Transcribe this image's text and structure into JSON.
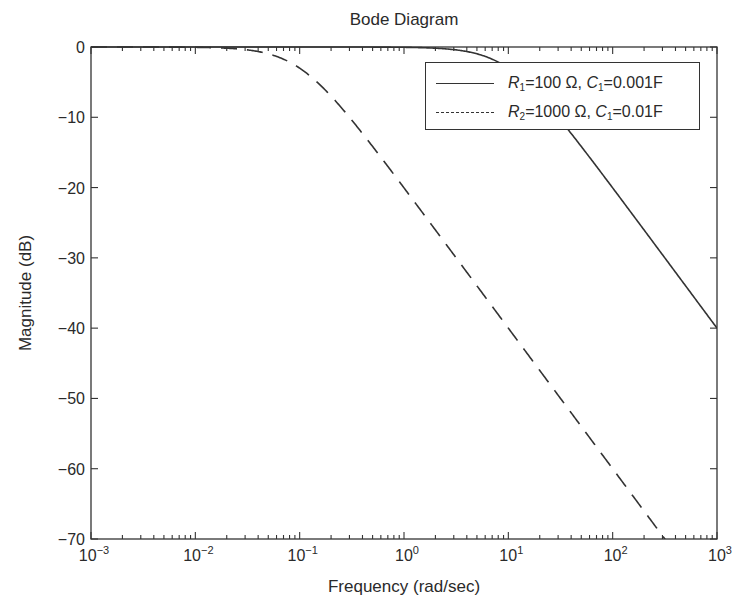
{
  "chart_data": {
    "type": "line",
    "title": "Bode Diagram",
    "xlabel": "Frequency (rad/sec)",
    "ylabel": "Magnitude (dB)",
    "xscale": "log",
    "xlim": [
      0.001,
      1000
    ],
    "ylim": [
      -70,
      0
    ],
    "grid": false,
    "legend_position": "upper right",
    "x_ticks": [
      0.001,
      0.01,
      0.1,
      1,
      10,
      100,
      1000
    ],
    "x_tick_labels": [
      {
        "base": "10",
        "exp": "−3"
      },
      {
        "base": "10",
        "exp": "−2"
      },
      {
        "base": "10",
        "exp": "−1"
      },
      {
        "base": "10",
        "exp": "0"
      },
      {
        "base": "10",
        "exp": "1"
      },
      {
        "base": "10",
        "exp": "2"
      },
      {
        "base": "10",
        "exp": "3"
      }
    ],
    "y_ticks": [
      0,
      -10,
      -20,
      -30,
      -40,
      -50,
      -60,
      -70
    ],
    "y_tick_labels": [
      "0",
      "−10",
      "−20",
      "−30",
      "−40",
      "−50",
      "−60",
      "−70"
    ],
    "series": [
      {
        "name": "R1=100 Ω, C1=0.001F",
        "style": "solid",
        "color": "#333333",
        "corner_frequency": 10,
        "x": [
          0.001,
          0.01,
          0.1,
          1,
          3,
          10,
          30,
          100,
          300,
          1000
        ],
        "values": [
          0,
          0,
          0,
          -0.04,
          -0.37,
          -3.01,
          -10.0,
          -20.04,
          -29.54,
          -40.0
        ]
      },
      {
        "name": "R2=1000 Ω, C1=0.01F",
        "style": "dashed",
        "color": "#333333",
        "corner_frequency": 0.1,
        "x": [
          0.001,
          0.01,
          0.03,
          0.1,
          0.3,
          1,
          3,
          10,
          30,
          100,
          316
        ],
        "values": [
          0,
          -0.04,
          -0.37,
          -3.01,
          -10.0,
          -20.04,
          -29.54,
          -40.0,
          -49.54,
          -60.0,
          -70.0
        ]
      }
    ]
  },
  "legend": {
    "items": [
      {
        "r": "R",
        "r_sub": "1",
        "r_val": "=100 Ω, ",
        "c": "C",
        "c_sub": "1",
        "c_val": "=0.001F"
      },
      {
        "r": "R",
        "r_sub": "2",
        "r_val": "=1000 Ω, ",
        "c": "C",
        "c_sub": "1",
        "c_val": "=0.01F"
      }
    ]
  }
}
